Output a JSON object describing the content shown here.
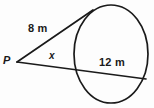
{
  "figure": {
    "type": "circle-tangent-secant-geometry-diagram",
    "background_color": "#fdfdfd",
    "stroke_color": "#1a1a1a",
    "labels": {
      "tangent_length": "8 m",
      "chord_length": "12 m",
      "external_point": "P",
      "unknown_segment": "x"
    },
    "shapes": {
      "circle": {
        "name": "circle",
        "center_x": 111,
        "center_y": 54,
        "radius_x": 37,
        "radius_y": 49,
        "stroke_width": 1.7
      },
      "tangent_line": {
        "name": "tangent-line",
        "from_x": 17,
        "from_y": 62,
        "to_x": 93,
        "to_y": 10,
        "stroke_width": 1.7
      },
      "secant_line": {
        "name": "secant-line",
        "from_x": 17,
        "from_y": 62,
        "to_x": 146,
        "to_y": 79,
        "stroke_width": 1.7
      },
      "vertex_point": {
        "name": "vertex-point-p",
        "x": 17,
        "y": 62
      }
    }
  }
}
